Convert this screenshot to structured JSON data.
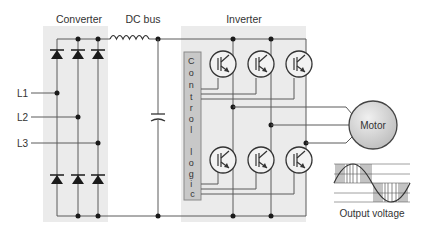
{
  "sections": {
    "converter": {
      "label": "Converter"
    },
    "dc_bus": {
      "label": "DC bus"
    },
    "inverter": {
      "label": "Inverter"
    }
  },
  "inputs": [
    {
      "label": "L1"
    },
    {
      "label": "L2"
    },
    {
      "label": "L3"
    }
  ],
  "control_logic": {
    "letters": [
      "C",
      "o",
      "n",
      "t",
      "r",
      "o",
      "l",
      "",
      "l",
      "o",
      "g",
      "i",
      "c"
    ]
  },
  "motor": {
    "label": "Motor"
  },
  "output": {
    "label": "Output voltage"
  },
  "colors": {
    "shade": "#ebebeb",
    "control_box": "#c8c8c8",
    "motor_fill": "#d4d4d4",
    "wire": "#5a5a5a"
  }
}
